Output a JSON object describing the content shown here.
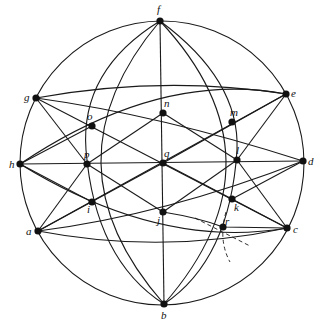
{
  "diagram": {
    "type": "stereographic-projection",
    "primitive_circle": {
      "cx": 162,
      "cy": 163,
      "r": 142
    },
    "points": [
      {
        "id": "f",
        "label": "f",
        "x": 160,
        "y": 21,
        "lx": 157,
        "ly": 13
      },
      {
        "id": "g",
        "label": "g",
        "x": 36,
        "y": 98,
        "lx": 24,
        "ly": 101
      },
      {
        "id": "o",
        "label": "o",
        "x": 92,
        "y": 126,
        "lx": 87,
        "ly": 120
      },
      {
        "id": "n",
        "label": "n",
        "x": 163,
        "y": 113,
        "lx": 164,
        "ly": 107
      },
      {
        "id": "m",
        "label": "m",
        "x": 232,
        "y": 122,
        "lx": 230,
        "ly": 116
      },
      {
        "id": "e",
        "label": "e",
        "x": 286,
        "y": 94,
        "lx": 291,
        "ly": 97
      },
      {
        "id": "h",
        "label": "h",
        "x": 20,
        "y": 164,
        "lx": 9,
        "ly": 168
      },
      {
        "id": "p",
        "label": "p",
        "x": 87,
        "y": 164,
        "lx": 84,
        "ly": 158
      },
      {
        "id": "q",
        "label": "q",
        "x": 163,
        "y": 163,
        "lx": 164,
        "ly": 157
      },
      {
        "id": "l",
        "label": "l",
        "x": 237,
        "y": 160,
        "lx": 236,
        "ly": 154
      },
      {
        "id": "d",
        "label": "d",
        "x": 303,
        "y": 161,
        "lx": 308,
        "ly": 165
      },
      {
        "id": "i",
        "label": "i",
        "x": 92,
        "y": 202,
        "lx": 87,
        "ly": 213
      },
      {
        "id": "a",
        "label": "a",
        "x": 38,
        "y": 231,
        "lx": 26,
        "ly": 235
      },
      {
        "id": "j",
        "label": "j",
        "x": 163,
        "y": 212,
        "lx": 157,
        "ly": 224
      },
      {
        "id": "k",
        "label": "k",
        "x": 232,
        "y": 199,
        "lx": 234,
        "ly": 211
      },
      {
        "id": "r",
        "label": "r",
        "x": 223,
        "y": 227,
        "lx": 225,
        "ly": 225
      },
      {
        "id": "c",
        "label": "c",
        "x": 287,
        "y": 228,
        "lx": 293,
        "ly": 233
      },
      {
        "id": "b",
        "label": "b",
        "x": 164,
        "y": 304,
        "lx": 161,
        "ly": 319
      }
    ],
    "arcs": [
      {
        "name": "meridian-fb-straight",
        "d": "M160 21 L164 304"
      },
      {
        "name": "diameter-hd",
        "d": "M20 164 L303 161"
      },
      {
        "name": "meridian-f-p-b",
        "d": "M160 21 Q40 163 164 304"
      },
      {
        "name": "meridian-f-l-b",
        "d": "M160 21 Q290 160 164 304"
      },
      {
        "name": "meridian-f-o-i-b",
        "d": "M160 21 Q80 70 86 150 Q95 260 164 304"
      },
      {
        "name": "meridian-f-m-k-b",
        "d": "M160 21 Q240 80 237 150 Q230 260 164 304"
      },
      {
        "name": "small-circle-g-n-e",
        "d": "M36 98 Q163 75 286 94"
      },
      {
        "name": "small-circle-a-j-c",
        "d": "M38 231 Q163 255 287 228"
      },
      {
        "name": "great-circle-h-o-n-e",
        "d": "M20 164 Q160 70 286 94"
      },
      {
        "name": "great-circle-g-n-m-d",
        "d": "M36 98 Q160 115 303 161"
      },
      {
        "name": "great-circle-h-i-j-c",
        "d": "M20 164 Q160 250 287 228"
      },
      {
        "name": "great-circle-a-j-k-d",
        "d": "M38 231 Q165 215 303 161"
      },
      {
        "name": "line-g-q-c",
        "d": "M36 98 L287 228"
      },
      {
        "name": "line-e-q-a",
        "d": "M286 94 L38 231"
      },
      {
        "name": "line-g-o-p",
        "d": "M36 98 L87 164"
      },
      {
        "name": "line-h-o",
        "d": "M20 164 L92 126"
      },
      {
        "name": "line-p-o-n",
        "d": "M87 164 L163 113"
      },
      {
        "name": "line-n-m-l",
        "d": "M163 113 L237 160"
      },
      {
        "name": "line-e-m-q",
        "d": "M286 94 L163 163"
      },
      {
        "name": "line-e-l",
        "d": "M286 94 L237 160"
      },
      {
        "name": "line-d-l-k",
        "d": "M303 161 L232 199"
      },
      {
        "name": "line-l-c",
        "d": "M237 160 L287 228"
      },
      {
        "name": "line-p-j",
        "d": "M87 164 L163 212"
      },
      {
        "name": "line-h-i-j",
        "d": "M20 164 L92 202"
      },
      {
        "name": "line-a-p",
        "d": "M38 231 L87 164"
      },
      {
        "name": "line-a-i-q",
        "d": "M38 231 L163 163"
      },
      {
        "name": "line-j-k-l",
        "d": "M163 212 L237 160"
      },
      {
        "name": "line-k-c",
        "d": "M232 199 L287 228"
      },
      {
        "name": "line-j-r-c",
        "d": "M163 212 Q200 218 223 227 L287 228"
      },
      {
        "name": "line-q-k",
        "d": "M163 163 L232 199"
      }
    ],
    "dashed": [
      {
        "name": "dashed-construction-1",
        "d": "M195 218 L250 246"
      },
      {
        "name": "dashed-construction-2",
        "d": "M226 212 Q218 240 230 262"
      }
    ]
  }
}
